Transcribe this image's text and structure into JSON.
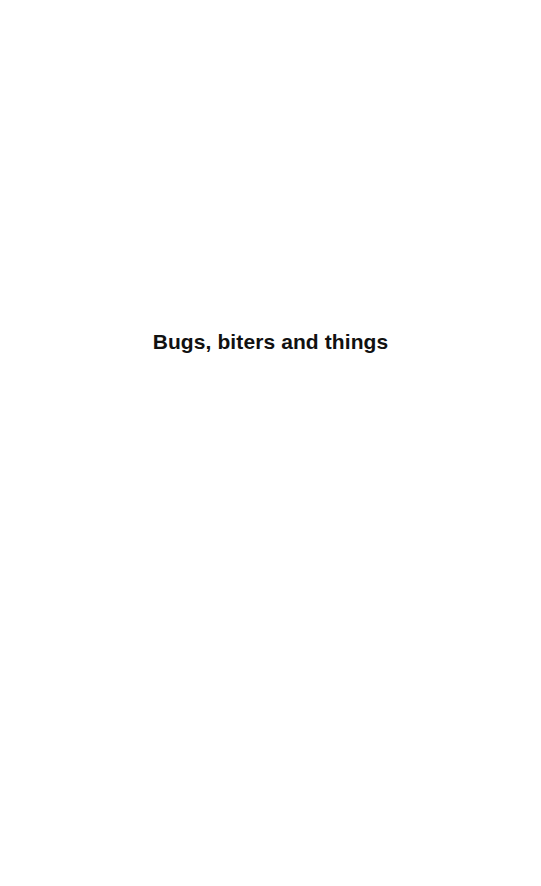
{
  "page": {
    "half_title": "Bugs, biters and things",
    "background_color": "#ffffff",
    "text_color": "#111111"
  }
}
